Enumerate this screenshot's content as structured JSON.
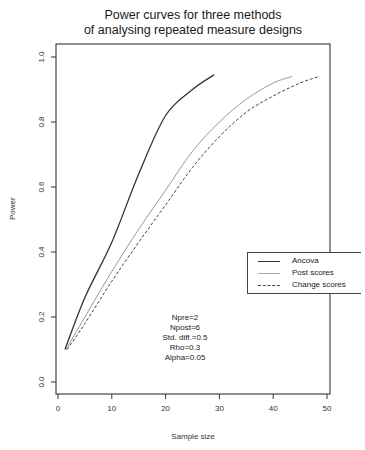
{
  "title_lines": [
    "Power curves for three methods",
    "of analysing repeated measure designs"
  ],
  "axes": {
    "xlabel": "Sample size",
    "ylabel": "Power",
    "xticks": [
      "0",
      "10",
      "20",
      "30",
      "40",
      "50"
    ],
    "yticks": [
      "0.0",
      "0.2",
      "0.4",
      "0.6",
      "0.8",
      "1.0"
    ]
  },
  "legend": {
    "items": [
      {
        "label": "Ancova",
        "style": "solid-dark"
      },
      {
        "label": "Post scores",
        "style": "solid-light"
      },
      {
        "label": "Change scores",
        "style": "dashed"
      }
    ]
  },
  "annotation_lines": [
    "Npre=2",
    "Npost=6",
    "Std. diff.=0.5",
    "Rho=0.3",
    "Alpha=0.05"
  ],
  "chart_data": {
    "type": "line",
    "title": "Power curves for three methods of analysing repeated measure designs",
    "xlabel": "Sample size",
    "ylabel": "Power",
    "xlim": [
      0,
      50
    ],
    "ylim": [
      0,
      1.0
    ],
    "xticks": [
      0,
      10,
      20,
      30,
      40,
      50
    ],
    "yticks": [
      0.0,
      0.2,
      0.4,
      0.6,
      0.8,
      1.0
    ],
    "grid": false,
    "legend_position": "right-middle",
    "annotation": "Npre=2, Npost=6, Std. diff.=0.5, Rho=0.3, Alpha=0.05",
    "series": [
      {
        "name": "Ancova",
        "line": "solid",
        "color": "#333333",
        "x": [
          1.3,
          5,
          10,
          15,
          20,
          25,
          29
        ],
        "y": [
          0.1,
          0.26,
          0.43,
          0.64,
          0.82,
          0.9,
          0.945
        ]
      },
      {
        "name": "Post scores",
        "line": "solid-thin",
        "color": "#888888",
        "x": [
          1.5,
          5,
          10,
          15,
          20,
          25,
          30,
          35,
          40,
          43.5
        ],
        "y": [
          0.1,
          0.2,
          0.34,
          0.47,
          0.59,
          0.71,
          0.8,
          0.87,
          0.92,
          0.94
        ]
      },
      {
        "name": "Change scores",
        "line": "dashed",
        "color": "#444444",
        "x": [
          1.7,
          5,
          10,
          15,
          20,
          25,
          30,
          35,
          40,
          45,
          48.5
        ],
        "y": [
          0.1,
          0.18,
          0.31,
          0.43,
          0.545,
          0.66,
          0.755,
          0.83,
          0.88,
          0.92,
          0.94
        ]
      }
    ]
  }
}
